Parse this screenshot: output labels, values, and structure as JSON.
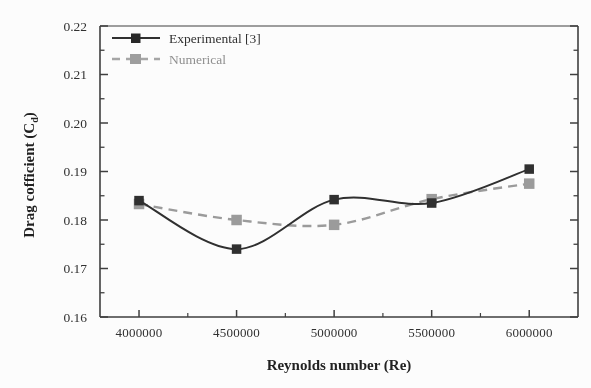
{
  "chart_data": {
    "type": "line",
    "title": "",
    "xlabel": "Reynolds number (Re)",
    "ylabel": "Drag cofficient (Cₑ)",
    "ylabel_main": "Drag cofficient (C",
    "ylabel_sub": "d",
    "ylabel_tail": ")",
    "x": [
      4000000,
      4500000,
      5000000,
      5500000,
      6000000
    ],
    "xtick_labels": [
      "4000000",
      "4500000",
      "5000000",
      "5500000",
      "6000000"
    ],
    "ytick_labels": [
      "0.16",
      "0.17",
      "0.18",
      "0.19",
      "0.20",
      "0.21",
      "0.22"
    ],
    "ytick_values": [
      0.16,
      0.17,
      0.18,
      0.19,
      0.2,
      0.21,
      0.22
    ],
    "yminor_values": [
      0.165,
      0.175,
      0.185,
      0.195,
      0.205,
      0.215
    ],
    "xlim": [
      3800000,
      6250000
    ],
    "ylim": [
      0.16,
      0.22
    ],
    "grid": false,
    "legend_position": "top-left inside",
    "series": [
      {
        "name": "Experimental [3]",
        "style": "solid",
        "color": "#2a2a2a",
        "marker": "square-filled",
        "values": [
          0.184,
          0.174,
          0.1842,
          0.1835,
          0.1905
        ]
      },
      {
        "name": "Numerical",
        "style": "dashed",
        "color": "#9a9a9a",
        "marker": "square-filled",
        "values": [
          0.1833,
          0.18,
          0.179,
          0.1843,
          0.1875
        ]
      }
    ]
  },
  "legend": {
    "items": [
      {
        "label": "Experimental [3]"
      },
      {
        "label": "Numerical"
      }
    ]
  },
  "axes": {
    "x_title": "Reynolds number (Re)",
    "y_title_main": "Drag cofficient (C",
    "y_title_sub": "d",
    "y_title_tail": ")"
  },
  "colors": {
    "experimental": "#2a2a2a",
    "numerical": "#9a9a9a",
    "axis": "#3a3a3a",
    "background": "#ffffff"
  }
}
